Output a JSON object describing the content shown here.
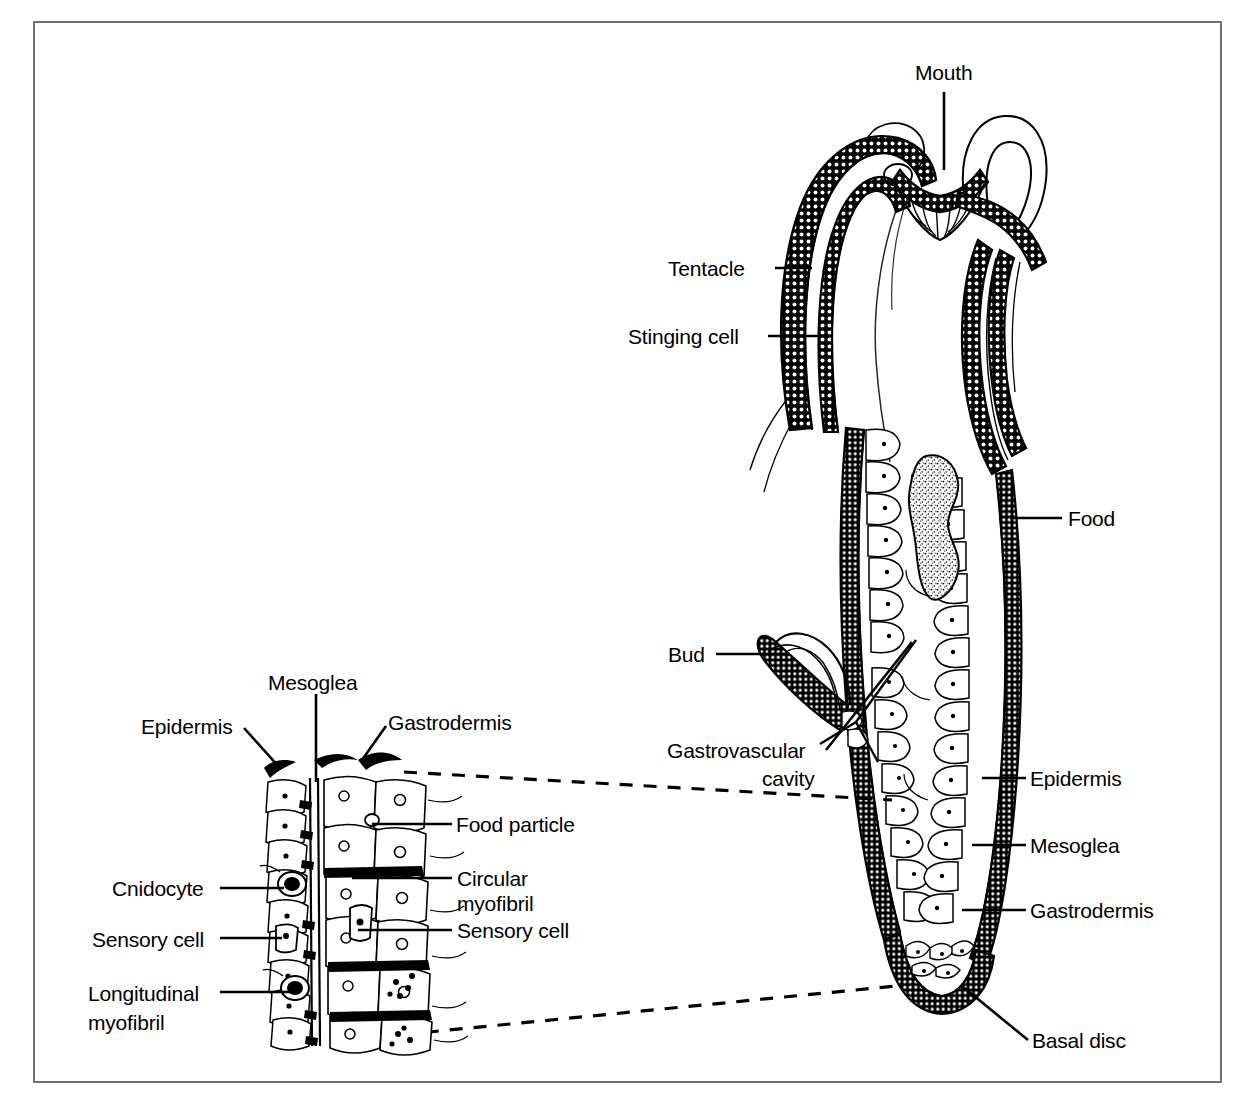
{
  "figure": {
    "border_color": "#6f6f6f",
    "ink_color": "#000000",
    "background": "#ffffff"
  },
  "labels": {
    "mouth": "Mouth",
    "tentacle": "Tentacle",
    "stinging_cell": "Stinging cell",
    "food": "Food",
    "bud": "Bud",
    "gastrovascular_1": "Gastrovascular",
    "gastrovascular_2": "cavity",
    "epidermis_main": "Epidermis",
    "mesoglea_main": "Mesoglea",
    "gastrodermis_main": "Gastrodermis",
    "basal_disc": "Basal disc",
    "inset_mesoglea": "Mesoglea",
    "inset_epidermis": "Epidermis",
    "inset_gastrodermis": "Gastrodermis",
    "food_particle": "Food particle",
    "circular_1": "Circular",
    "circular_2": "myofibril",
    "sensory_cell_right": "Sensory cell",
    "cnidocyte": "Cnidocyte",
    "sensory_cell_left": "Sensory cell",
    "longitudinal_1": "Longitudinal",
    "longitudinal_2": "myofibril"
  },
  "structures": {
    "whole_animal": "hydra-longitudinal-section",
    "inset": "body-wall-magnification",
    "connector": "dashed-magnification-lines"
  }
}
